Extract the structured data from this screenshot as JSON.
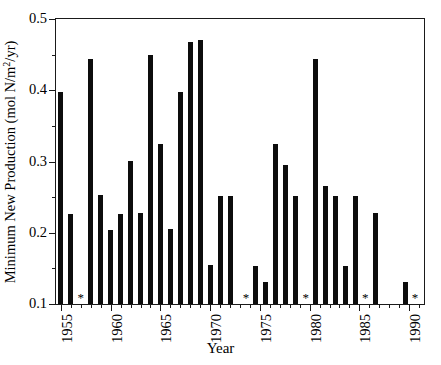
{
  "chart_data": {
    "type": "bar",
    "title": "",
    "xlabel": "Year",
    "ylabel": "Minimum New Production (mol N/m2/yr)",
    "ylabel_parts": {
      "pre": "Minimum New Production (mol N/m",
      "sup": "2",
      "post": "/yr)"
    },
    "xlim": [
      1954.5,
      1991.5
    ],
    "ylim": [
      0.1,
      0.5
    ],
    "ytick_labels": [
      "0.1",
      "0.2",
      "0.3",
      "0.4",
      "0.5"
    ],
    "ytick_values": [
      0.1,
      0.2,
      0.3,
      0.4,
      0.5
    ],
    "yminor_values": [
      0.15,
      0.25,
      0.35,
      0.45
    ],
    "xtick_labels": [
      "1955",
      "1960",
      "1965",
      "1970",
      "1975",
      "1980",
      "1985",
      "1990"
    ],
    "xtick_values": [
      1955,
      1960,
      1965,
      1970,
      1975,
      1980,
      1985,
      1990
    ],
    "grid": false,
    "legend": null,
    "bar_color": "#0d0d0d",
    "missing_marker": "*",
    "missing_years": [
      1957,
      1974,
      1980,
      1986,
      1991
    ],
    "categories": [
      1955,
      1956,
      1957,
      1958,
      1959,
      1960,
      1961,
      1962,
      1963,
      1964,
      1965,
      1966,
      1967,
      1968,
      1969,
      1970,
      1971,
      1972,
      1973,
      1974,
      1975,
      1976,
      1977,
      1978,
      1979,
      1980,
      1981,
      1982,
      1983,
      1984,
      1985,
      1986,
      1987,
      1988,
      1989,
      1990,
      1991
    ],
    "values": [
      0.397,
      0.227,
      null,
      0.444,
      0.253,
      0.204,
      0.227,
      0.301,
      0.228,
      0.45,
      0.325,
      0.205,
      0.398,
      0.468,
      0.47,
      0.155,
      0.252,
      0.252,
      null,
      0.153,
      0.131,
      0.325,
      0.295,
      0.252,
      null,
      0.444,
      0.265,
      0.252,
      0.153,
      0.252,
      null,
      0.228,
      0.131,
      null,
      null,
      null,
      null
    ],
    "points": [
      {
        "year": 1955,
        "value": 0.397
      },
      {
        "year": 1956,
        "value": 0.227
      },
      {
        "year": 1957,
        "value": null
      },
      {
        "year": 1958,
        "value": 0.444
      },
      {
        "year": 1959,
        "value": 0.253
      },
      {
        "year": 1960,
        "value": 0.204
      },
      {
        "year": 1961,
        "value": 0.227
      },
      {
        "year": 1962,
        "value": 0.301
      },
      {
        "year": 1963,
        "value": 0.228
      },
      {
        "year": 1964,
        "value": 0.45
      },
      {
        "year": 1965,
        "value": 0.325
      },
      {
        "year": 1966,
        "value": 0.205
      },
      {
        "year": 1967,
        "value": 0.398
      },
      {
        "year": 1968,
        "value": 0.468
      },
      {
        "year": 1969,
        "value": 0.47
      },
      {
        "year": 1970,
        "value": 0.155
      },
      {
        "year": 1971,
        "value": 0.252
      },
      {
        "year": 1972,
        "value": 0.252
      },
      {
        "year": 1973,
        "value": null
      },
      {
        "year": 1974,
        "value": 0.153
      },
      {
        "year": 1975,
        "value": 0.131
      },
      {
        "year": 1976,
        "value": 0.325
      },
      {
        "year": 1977,
        "value": 0.295
      },
      {
        "year": 1978,
        "value": 0.252
      },
      {
        "year": 1979,
        "value": null
      },
      {
        "year": 1980,
        "value": 0.444
      },
      {
        "year": 1981,
        "value": 0.265
      },
      {
        "year": 1982,
        "value": 0.252
      },
      {
        "year": 1983,
        "value": 0.153
      },
      {
        "year": 1984,
        "value": 0.252
      },
      {
        "year": 1985,
        "value": null
      },
      {
        "year": 1986,
        "value": 0.228
      },
      {
        "year": 1987,
        "value": 0.131
      },
      {
        "year": 1988,
        "value": null
      },
      {
        "year": 1989,
        "value": null
      },
      {
        "year": 1990,
        "value": null
      },
      {
        "year": 1991,
        "value": null
      }
    ],
    "bars": [
      {
        "year": 1955.0,
        "value": 0.397
      },
      {
        "year": 1956.0,
        "value": 0.227
      },
      {
        "year": 1958.0,
        "value": 0.444
      },
      {
        "year": 1959.0,
        "value": 0.253
      },
      {
        "year": 1960.0,
        "value": 0.204
      },
      {
        "year": 1961.0,
        "value": 0.227
      },
      {
        "year": 1962.0,
        "value": 0.301
      },
      {
        "year": 1963.0,
        "value": 0.228
      },
      {
        "year": 1964.0,
        "value": 0.45
      },
      {
        "year": 1965.0,
        "value": 0.325
      },
      {
        "year": 1966.0,
        "value": 0.205
      },
      {
        "year": 1967.0,
        "value": 0.398
      },
      {
        "year": 1968.0,
        "value": 0.468
      },
      {
        "year": 1969.0,
        "value": 0.47
      },
      {
        "year": 1970.0,
        "value": 0.155
      },
      {
        "year": 1971.0,
        "value": 0.252
      },
      {
        "year": 1972.0,
        "value": 0.252
      },
      {
        "year": 1974.6,
        "value": 0.153
      },
      {
        "year": 1975.6,
        "value": 0.131
      },
      {
        "year": 1976.6,
        "value": 0.325
      },
      {
        "year": 1977.6,
        "value": 0.295
      },
      {
        "year": 1978.6,
        "value": 0.252
      },
      {
        "year": 1980.6,
        "value": 0.444
      },
      {
        "year": 1981.6,
        "value": 0.265
      },
      {
        "year": 1982.6,
        "value": 0.252
      },
      {
        "year": 1983.6,
        "value": 0.153
      },
      {
        "year": 1984.6,
        "value": 0.252
      },
      {
        "year": 1986.6,
        "value": 0.228
      },
      {
        "year": 1989.6,
        "value": 0.131
      }
    ],
    "stars": [
      {
        "year": 1957.0
      },
      {
        "year": 1973.6
      },
      {
        "year": 1979.6
      },
      {
        "year": 1985.6
      },
      {
        "year": 1990.6
      }
    ]
  }
}
